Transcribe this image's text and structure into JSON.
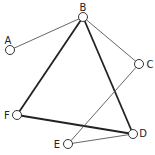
{
  "diagram": {
    "type": "graph",
    "nodes": [
      {
        "id": "A",
        "label": "A",
        "x": 10,
        "y": 50,
        "lx": 8,
        "ly": 44
      },
      {
        "id": "B",
        "label": "B",
        "x": 83,
        "y": 17,
        "lx": 83,
        "ly": 11
      },
      {
        "id": "C",
        "label": "C",
        "x": 139,
        "y": 64,
        "lx": 150,
        "ly": 68
      },
      {
        "id": "D",
        "label": "D",
        "x": 133,
        "y": 134,
        "lx": 143,
        "ly": 137
      },
      {
        "id": "E",
        "label": "E",
        "x": 68,
        "y": 144,
        "lx": 57,
        "ly": 148
      },
      {
        "id": "F",
        "label": "F",
        "x": 17,
        "y": 115,
        "lx": 7,
        "ly": 119
      }
    ],
    "edges": [
      {
        "from": "A",
        "to": "B",
        "weight": "thin"
      },
      {
        "from": "B",
        "to": "C",
        "weight": "thin"
      },
      {
        "from": "B",
        "to": "F",
        "weight": "thick"
      },
      {
        "from": "B",
        "to": "D",
        "weight": "thick"
      },
      {
        "from": "F",
        "to": "D",
        "weight": "thick"
      },
      {
        "from": "C",
        "to": "E",
        "weight": "thin"
      },
      {
        "from": "E",
        "to": "D",
        "weight": "thin"
      }
    ]
  }
}
